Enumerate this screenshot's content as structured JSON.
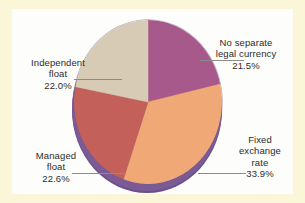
{
  "figure": {
    "background_color": "#fbf6d8",
    "plot_background_color": "#fdfdfb"
  },
  "chart_data": {
    "type": "pie",
    "title": "",
    "subtitle": "",
    "xlabel": "",
    "ylabel": "",
    "grid": false,
    "legend_position": "callout-labels",
    "start_angle_deg": 0,
    "direction": "clockwise",
    "three_d": true,
    "categories": [
      "No separate legal currency",
      "Fixed exchange rate",
      "Managed float",
      "Independent float"
    ],
    "values": [
      21.5,
      33.9,
      22.6,
      22.0
    ],
    "value_labels": [
      "21.5%",
      "33.9%",
      "22.6%",
      "22.0%"
    ],
    "colors": [
      "#a8598b",
      "#f0a877",
      "#c26059",
      "#d8cbb5"
    ],
    "side_wall_color": "#6b4f89",
    "leader_line_color": "#8b8b8b",
    "slices": [
      {
        "name": "no-separate-legal-currency",
        "label_line1": "No separate",
        "label_line2": "legal currency",
        "percent_text": "21.5%",
        "value": 21.5,
        "color": "#a8598b",
        "start_deg": 0,
        "end_deg": 77.4
      },
      {
        "name": "fixed-exchange-rate",
        "label_line1": "Fixed",
        "label_line2": "exchange",
        "label_line3": "rate",
        "percent_text": "33.9%",
        "value": 33.9,
        "color": "#f0a877",
        "start_deg": 77.4,
        "end_deg": 199.4
      },
      {
        "name": "managed-float",
        "label_line1": "Managed",
        "label_line2": "float",
        "percent_text": "22.6%",
        "value": 22.6,
        "color": "#c26059",
        "start_deg": 199.4,
        "end_deg": 280.8
      },
      {
        "name": "independent-float",
        "label_line1": "Independent",
        "label_line2": "float",
        "percent_text": "22.0%",
        "value": 22.0,
        "color": "#d8cbb5",
        "start_deg": 280.8,
        "end_deg": 360
      }
    ]
  },
  "labels": {
    "no_separate": {
      "text": "No separate\nlegal currency",
      "percent": "21.5%"
    },
    "fixed": {
      "text": "Fixed\nexchange\nrate",
      "percent": "33.9%"
    },
    "independent": {
      "text": "Independent\nfloat",
      "percent": "22.0%"
    },
    "managed": {
      "text": "Managed\nfloat",
      "percent": "22.6%"
    }
  }
}
